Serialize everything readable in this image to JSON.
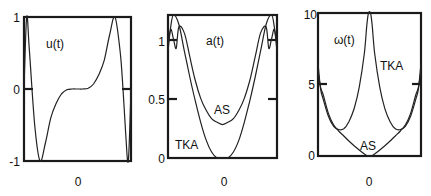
{
  "chart_data": [
    {
      "type": "line",
      "title": "u(t)",
      "xlabel": "",
      "ylabel": "",
      "x_ticks": [
        "0"
      ],
      "y_ticks": [
        "-1",
        "0",
        "1"
      ],
      "ylim": [
        -1,
        1
      ],
      "xlim": [
        -1,
        1
      ],
      "grid": false,
      "series": [
        {
          "name": "u(t)",
          "x": [
            -1.0,
            -0.95,
            -0.9,
            -0.8,
            -0.7,
            -0.6,
            -0.5,
            -0.4,
            -0.3,
            -0.2,
            -0.1,
            0.0,
            0.1,
            0.2,
            0.3,
            0.4,
            0.5,
            0.6,
            0.7,
            0.8,
            0.85,
            0.9,
            0.95,
            1.0
          ],
          "values": [
            0.0,
            1.0,
            0.55,
            -0.5,
            -1.0,
            -0.75,
            -0.4,
            -0.2,
            -0.07,
            -0.01,
            0.0,
            0.0,
            0.0,
            0.01,
            0.07,
            0.2,
            0.4,
            0.75,
            1.0,
            0.5,
            0.0,
            -0.6,
            -1.0,
            0.0
          ]
        }
      ],
      "annotations": [
        {
          "text": "u(t)",
          "x": -0.55,
          "y": 0.75
        }
      ]
    },
    {
      "type": "line",
      "title": "a(t)",
      "xlabel": "",
      "ylabel": "",
      "x_ticks": [
        "0"
      ],
      "y_ticks": [
        "0",
        "0.5",
        "1"
      ],
      "ylim": [
        0,
        1.2
      ],
      "xlim": [
        -1,
        1
      ],
      "grid": false,
      "series": [
        {
          "name": "AS",
          "x": [
            -1.0,
            -0.95,
            -0.9,
            -0.85,
            -0.8,
            -0.7,
            -0.6,
            -0.5,
            -0.4,
            -0.3,
            -0.2,
            -0.1,
            0.0,
            0.1,
            0.2,
            0.3,
            0.4,
            0.5,
            0.6,
            0.7,
            0.8,
            0.85,
            0.9,
            0.95,
            1.0
          ],
          "values": [
            0.95,
            1.08,
            1.0,
            0.92,
            1.1,
            1.05,
            0.85,
            0.65,
            0.5,
            0.4,
            0.33,
            0.3,
            0.28,
            0.3,
            0.33,
            0.4,
            0.5,
            0.65,
            0.85,
            1.05,
            1.1,
            0.92,
            1.0,
            1.08,
            0.95
          ]
        },
        {
          "name": "TKA",
          "x": [
            -1.0,
            -0.95,
            -0.9,
            -0.8,
            -0.7,
            -0.6,
            -0.5,
            -0.4,
            -0.3,
            -0.2,
            -0.1,
            0.0,
            0.1,
            0.2,
            0.3,
            0.4,
            0.5,
            0.6,
            0.7,
            0.8,
            0.9,
            0.95,
            1.0
          ],
          "values": [
            0.9,
            1.1,
            1.2,
            1.12,
            0.9,
            0.68,
            0.48,
            0.3,
            0.15,
            0.05,
            0.0,
            0.0,
            0.0,
            0.05,
            0.15,
            0.3,
            0.48,
            0.68,
            0.9,
            1.12,
            1.2,
            1.1,
            0.9
          ]
        }
      ],
      "annotations": [
        {
          "text": "a(t)",
          "x": -0.05,
          "y": 1.05
        },
        {
          "text": "AS",
          "x": 0.05,
          "y": 0.38
        },
        {
          "text": "TKA",
          "x": -0.75,
          "y": 0.12
        }
      ]
    },
    {
      "type": "line",
      "title": "ω(t)",
      "xlabel": "",
      "ylabel": "",
      "x_ticks": [
        "0"
      ],
      "y_ticks": [
        "0",
        "5",
        "10"
      ],
      "ylim": [
        0,
        10
      ],
      "xlim": [
        -1,
        1
      ],
      "grid": false,
      "series": [
        {
          "name": "TKA",
          "x": [
            -1.0,
            -0.95,
            -0.9,
            -0.8,
            -0.7,
            -0.6,
            -0.5,
            -0.4,
            -0.3,
            -0.2,
            -0.1,
            -0.05,
            -0.02,
            0.02,
            0.05,
            0.1,
            0.2,
            0.3,
            0.4,
            0.5,
            0.6,
            0.7,
            0.8,
            0.9,
            0.95,
            1.0
          ],
          "values": [
            6.5,
            4.7,
            4.0,
            2.8,
            2.1,
            1.85,
            1.9,
            2.4,
            3.3,
            4.8,
            7.2,
            9.2,
            10.0,
            10.0,
            9.2,
            7.2,
            4.8,
            3.3,
            2.4,
            1.9,
            1.85,
            2.1,
            2.8,
            4.0,
            4.7,
            6.5
          ]
        },
        {
          "name": "AS",
          "x": [
            -1.0,
            -0.95,
            -0.9,
            -0.8,
            -0.7,
            -0.6,
            -0.5,
            -0.4,
            -0.3,
            -0.2,
            -0.1,
            -0.03,
            0.0,
            0.03,
            0.1,
            0.2,
            0.3,
            0.4,
            0.5,
            0.6,
            0.7,
            0.8,
            0.9,
            0.95,
            1.0
          ],
          "values": [
            6.0,
            4.8,
            4.3,
            3.0,
            2.2,
            1.75,
            1.4,
            1.05,
            0.72,
            0.42,
            0.15,
            0.0,
            0.0,
            0.0,
            0.15,
            0.42,
            0.72,
            1.05,
            1.4,
            1.75,
            2.2,
            3.0,
            4.3,
            4.8,
            6.0
          ]
        }
      ],
      "annotations": [
        {
          "text": "ω(t)",
          "x": -0.55,
          "y": 8.0
        },
        {
          "text": "TKA",
          "x": 0.55,
          "y": 6.0
        },
        {
          "text": "AS",
          "x": 0.0,
          "y": 0.8
        }
      ]
    }
  ],
  "panels": [
    {
      "frame": {
        "x0": 24,
        "y0": 17,
        "x1": 131,
        "y1": 161
      }
    },
    {
      "frame": {
        "x0": 168,
        "y0": 15,
        "x1": 277,
        "y1": 158
      }
    },
    {
      "frame": {
        "x0": 318,
        "y0": 13,
        "x1": 421,
        "y1": 156
      }
    }
  ]
}
